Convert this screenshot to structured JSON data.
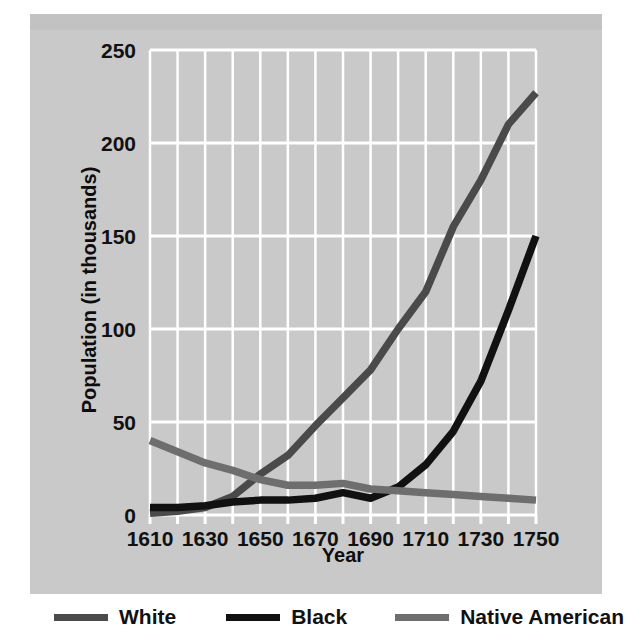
{
  "chart_data": {
    "type": "line",
    "title": "",
    "xlabel": "Year",
    "ylabel": "Population (in thousands)",
    "x": [
      1610,
      1620,
      1630,
      1640,
      1650,
      1660,
      1670,
      1680,
      1690,
      1700,
      1710,
      1720,
      1730,
      1740,
      1750
    ],
    "xlim": [
      1610,
      1750
    ],
    "ylim": [
      0,
      250
    ],
    "xticks": [
      "1610",
      "1630",
      "1650",
      "1670",
      "1690",
      "1710",
      "1730",
      "1750"
    ],
    "xtick_values": [
      1610,
      1630,
      1650,
      1670,
      1690,
      1710,
      1730,
      1750
    ],
    "yticks": [
      "0",
      "50",
      "100",
      "150",
      "200",
      "250"
    ],
    "ytick_values": [
      0,
      50,
      100,
      150,
      200,
      250
    ],
    "grid": "both, white gridlines every 10 years and every 50 thousand",
    "legend_position": "below plot, horizontal",
    "plot_background": "#c9c9c9",
    "series": [
      {
        "name": "White",
        "color": "#4a4a4a",
        "values": [
          1,
          2,
          4,
          10,
          22,
          32,
          48,
          63,
          78,
          100,
          120,
          155,
          180,
          210,
          227
        ]
      },
      {
        "name": "Black",
        "color": "#111111",
        "values": [
          4,
          4,
          5,
          7,
          8,
          8,
          9,
          12,
          9,
          15,
          27,
          45,
          72,
          110,
          150
        ]
      },
      {
        "name": "Native American",
        "color": "#6e6e6e",
        "values": [
          40,
          34,
          28,
          24,
          19,
          16,
          16,
          17,
          14,
          13,
          12,
          11,
          10,
          9,
          8
        ]
      }
    ]
  },
  "legend": {
    "items": [
      {
        "label": "White",
        "color": "#4a4a4a"
      },
      {
        "label": "Black",
        "color": "#111111"
      },
      {
        "label": "Native American",
        "color": "#6e6e6e"
      }
    ]
  },
  "axes": {
    "x_title": "Year",
    "y_title": "Population (in thousands)",
    "x_tick_labels": [
      "1610",
      "1630",
      "1650",
      "1670",
      "1690",
      "1710",
      "1730",
      "1750"
    ],
    "y_tick_labels": [
      "0",
      "50",
      "100",
      "150",
      "200",
      "250"
    ]
  }
}
